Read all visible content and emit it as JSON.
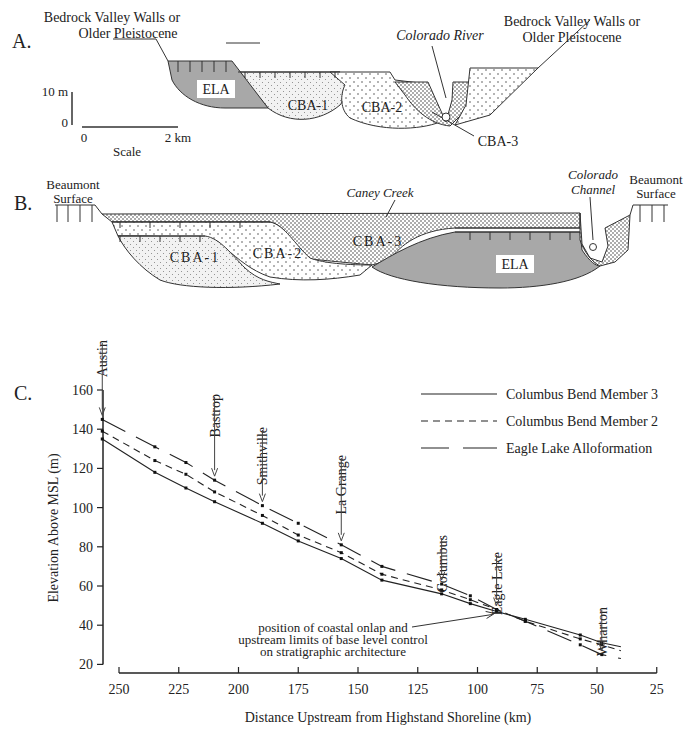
{
  "panel_a": {
    "label": "A.",
    "left_wall_label": [
      "Bedrock Valley Walls or",
      "Older Pleistocene"
    ],
    "right_wall_label": [
      "Bedrock Valley Walls or",
      "Older Pleistocene"
    ],
    "river_label": "Colorado River",
    "units": [
      "ELA",
      "CBA-1",
      "CBA-2",
      "CBA-3"
    ],
    "vertical_scale": {
      "top": "10 m",
      "bottom": "0"
    },
    "horizontal_scale": {
      "left": "0",
      "right": "2 km",
      "caption": "Scale"
    }
  },
  "panel_b": {
    "label": "B.",
    "left_surface_label": [
      "Beaumont",
      "Surface"
    ],
    "right_surface_label": [
      "Beaumont",
      "Surface"
    ],
    "creek_label": "Caney Creek",
    "channel_label": [
      "Colorado",
      "Channel"
    ],
    "units": [
      "CBA-1",
      "CBA-2",
      "CBA-3",
      "ELA"
    ]
  },
  "panel_c": {
    "label": "C."
  },
  "chart_data": {
    "type": "line",
    "title": "",
    "xlabel": "Distance Upstream from Highstand Shoreline (km)",
    "ylabel": "Elevation Above MSL (m)",
    "xlim": [
      250,
      25
    ],
    "ylim": [
      20,
      160
    ],
    "x_ticks": [
      250,
      225,
      200,
      175,
      150,
      125,
      100,
      75,
      50,
      25
    ],
    "y_ticks": [
      20,
      40,
      60,
      80,
      100,
      120,
      140,
      160
    ],
    "grid": false,
    "legend_position": "upper right",
    "series": [
      {
        "name": "Columbus Bend Member 3",
        "style": "solid",
        "x": [
          257,
          235,
          222,
          210,
          190,
          175,
          157,
          140,
          115,
          103,
          92,
          80,
          57,
          48,
          40
        ],
        "values": [
          135,
          118,
          110,
          103,
          92,
          83,
          74,
          63,
          56,
          51,
          47,
          43,
          35,
          31,
          29
        ]
      },
      {
        "name": "Columbus Bend Member 2",
        "style": "dashed",
        "x": [
          257,
          235,
          222,
          210,
          190,
          175,
          157,
          140,
          115,
          103,
          92,
          80,
          57,
          48,
          40
        ],
        "values": [
          139,
          124,
          117,
          108,
          96,
          86,
          77,
          66,
          58,
          53,
          48,
          42,
          33,
          30,
          27
        ]
      },
      {
        "name": "Eagle Lake Alloformation",
        "style": "long-dash",
        "x": [
          257,
          235,
          222,
          210,
          190,
          175,
          157,
          140,
          115,
          103,
          92,
          80,
          57,
          48,
          40
        ],
        "values": [
          145,
          131,
          123,
          114,
          101,
          92,
          81,
          70,
          61,
          55,
          48,
          42,
          30,
          25,
          23
        ]
      }
    ],
    "location_markers": [
      {
        "name": "Austin",
        "x": 257
      },
      {
        "name": "Bastrop",
        "x": 210
      },
      {
        "name": "Smithville",
        "x": 190
      },
      {
        "name": "La Grange",
        "x": 157
      },
      {
        "name": "Columbus",
        "x": 115
      },
      {
        "name": "Eagle Lake",
        "x": 92
      },
      {
        "name": "Wharton",
        "x": 48
      }
    ],
    "annotations": [
      {
        "text": [
          "position of coastal onlap and",
          "upstream limits of base level control",
          "on stratigraphic architecture"
        ],
        "points_to": [
          92,
          46
        ]
      }
    ]
  }
}
